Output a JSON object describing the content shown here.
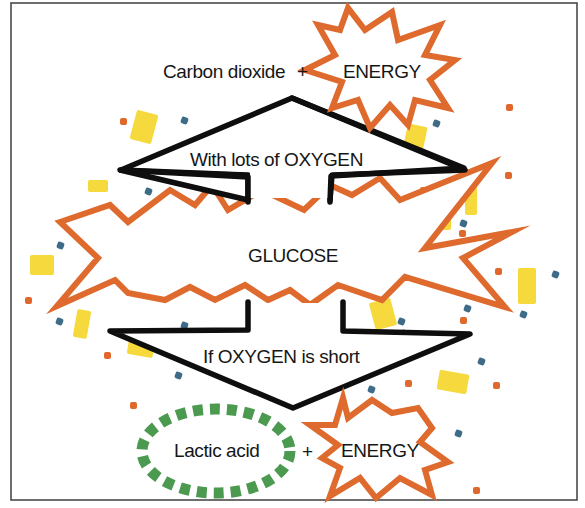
{
  "colors": {
    "burst_stroke": "#de6a2e",
    "arrow_stroke": "#0e0e0e",
    "confetti_yellow": "#f6d93c",
    "confetti_orange": "#e0682c",
    "confetti_blue": "#3e6b88",
    "lactic_ring": "#4b9a4f",
    "text": "#161616"
  },
  "labels": {
    "aerobic_product": "Carbon dioxide",
    "aerobic_plus": "+",
    "aerobic_energy": "ENERGY",
    "aerobic_condition": "With lots of OXYGEN",
    "source": "GLUCOSE",
    "anaerobic_condition": "If OXYGEN is short",
    "anaerobic_product": "Lactic acid",
    "anaerobic_plus": "+",
    "anaerobic_energy": "ENERGY"
  },
  "nodes": [
    {
      "id": "glucose",
      "label": "GLUCOSE",
      "shape": "starburst"
    },
    {
      "id": "aerobic-products",
      "label": "Carbon dioxide + ENERGY",
      "shape": "starburst"
    },
    {
      "id": "anaerobic-products",
      "label": "Lactic acid + ENERGY",
      "shape": "starburst + dashed ellipse"
    }
  ],
  "edges": [
    {
      "from": "glucose",
      "to": "aerobic-products",
      "label": "With lots of OXYGEN",
      "direction": "up"
    },
    {
      "from": "glucose",
      "to": "anaerobic-products",
      "label": "If OXYGEN is short",
      "direction": "down"
    }
  ]
}
